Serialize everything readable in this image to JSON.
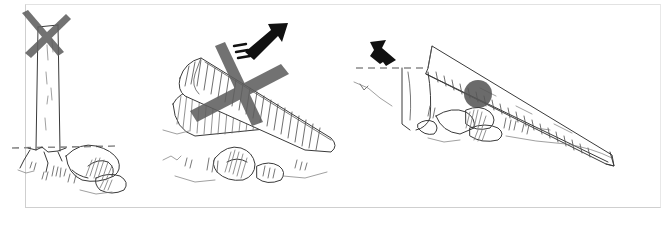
{
  "figure": {
    "style": "hand-drawn pencil and ink technical illustration",
    "background_color": "#ffffff",
    "frame": {
      "present": true,
      "border_color": "#cfcfcf"
    }
  },
  "panels": [
    {
      "id": "panel-1",
      "name": "upright-post-incorrect",
      "verdict": "incorrect",
      "verdict_marker": "x-mark",
      "subject": "vertical post standing upright in rocky ground",
      "elements": [
        {
          "name": "x-mark",
          "kind": "cross",
          "color": "#5f5f5f",
          "meaning": "do not"
        },
        {
          "name": "post",
          "kind": "wooden-post",
          "orientation": "vertical"
        },
        {
          "name": "ground-line",
          "kind": "dashed-line",
          "color": "#8a8a8a",
          "meaning": "ground level"
        },
        {
          "name": "rocks",
          "kind": "sketched-rocks"
        },
        {
          "name": "grass-tufts",
          "kind": "sketched-vegetation"
        }
      ]
    },
    {
      "id": "panel-2",
      "name": "log-tipping-upward-incorrect",
      "verdict": "incorrect",
      "verdict_marker": "x-mark",
      "subject": "log levering upward off a second log",
      "elements": [
        {
          "name": "motion-arrow",
          "kind": "arrow",
          "direction": "up-right",
          "color": "#111111",
          "meaning": "log kicks up"
        },
        {
          "name": "x-mark",
          "kind": "cross",
          "color": "#5f5f5f",
          "meaning": "do not"
        },
        {
          "name": "upper-log",
          "kind": "log",
          "orientation": "tilted"
        },
        {
          "name": "lower-log",
          "kind": "log",
          "orientation": "tilted",
          "shading": "hatched"
        },
        {
          "name": "rocks",
          "kind": "sketched-rocks"
        },
        {
          "name": "grass-tufts",
          "kind": "sketched-vegetation"
        }
      ]
    },
    {
      "id": "panel-3",
      "name": "log-lowered-down-slope-correct",
      "verdict": "correct",
      "verdict_marker": "none",
      "subject": "long log lowered down the slope over a pivot",
      "elements": [
        {
          "name": "motion-arrow",
          "kind": "arrow",
          "direction": "down-right",
          "color": "#111111",
          "meaning": "lower the log"
        },
        {
          "name": "ground-line",
          "kind": "dashed-line",
          "color": "#8a8a8a",
          "meaning": "ground level"
        },
        {
          "name": "long-log",
          "kind": "log",
          "orientation": "steep downward",
          "shading": "hatched underside"
        },
        {
          "name": "pivot-point",
          "kind": "filled-circle",
          "color": "#575757",
          "meaning": "fulcrum contact point"
        },
        {
          "name": "rocks",
          "kind": "sketched-rocks"
        },
        {
          "name": "grass-tufts",
          "kind": "sketched-vegetation"
        }
      ]
    }
  ],
  "legend": {
    "x_mark_meaning": "incorrect method",
    "arrow_meaning": "direction of movement",
    "dashed_line_meaning": "ground level"
  }
}
